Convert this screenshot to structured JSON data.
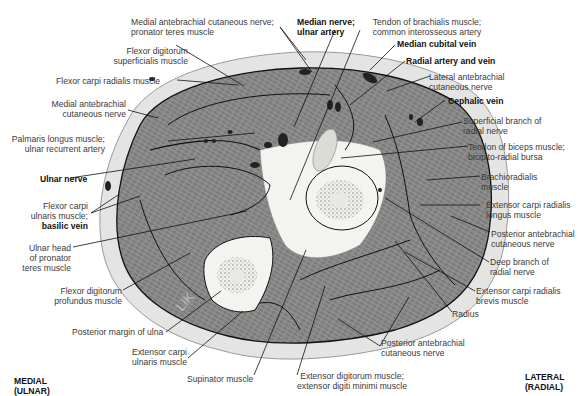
{
  "figure": {
    "orientation": {
      "medial": [
        "MEDIAL",
        "(ULNAR)"
      ],
      "lateral": [
        "LATERAL",
        "(RADIAL)"
      ]
    },
    "watermark": "LIK",
    "labels": {
      "medial_ante_cut_pronator": [
        "Medial antebrachial cutaneous nerve;",
        "pronator teres muscle"
      ],
      "fds": [
        "Flexor digitorum",
        "superficialis muscle"
      ],
      "fcr": "Flexor carpi radialis muscle",
      "medial_ante_cut": [
        "Medial antebrachial",
        "cutaneous nerve"
      ],
      "palmaris": [
        "Palmaris longus muscle;",
        "ulnar recurrent artery"
      ],
      "ulnar_nerve": "Ulnar nerve",
      "fcu": [
        "Flexor carpi",
        "ulnaris muscle;"
      ],
      "basilic_vein": "basilic vein",
      "ulnar_head": [
        "Ulnar head",
        "of pronator",
        "teres muscle"
      ],
      "fdp": [
        "Flexor digitorum",
        "profundus muscle"
      ],
      "post_margin_ulna": "Posterior margin of ulna",
      "ecu": [
        "Extensor carpi",
        "ulnaris muscle"
      ],
      "supinator": "Supinator muscle",
      "ed_edm": [
        "Extensor digitorum muscle;",
        "extensor digiti minimi muscle"
      ],
      "median_nerve_ulnar_artery": [
        "Median nerve;",
        "ulnar artery"
      ],
      "tendon_brachialis": [
        "Tendon of brachialis muscle;",
        "common interosseous artery"
      ],
      "median_cubital": "Median cubital vein",
      "radial_artery_vein": "Radial artery and vein",
      "lateral_ante_cut": [
        "Lateral antebrachial",
        "cutaneous nerve"
      ],
      "cephalic": "Cephalic vein",
      "superficial_radial": [
        "Superficial branch of",
        "radial nerve"
      ],
      "tendon_biceps": [
        "Tendon of biceps muscle;",
        "bicipito-radial bursa"
      ],
      "brachioradialis": [
        "Brachioradialis",
        "muscle"
      ],
      "ecrl": [
        "Extensor carpi radialis",
        "longus muscle"
      ],
      "post_ante_cut_right": [
        "Posterior antebrachial",
        "cutaneous nerve"
      ],
      "deep_radial": [
        "Deep branch of",
        "radial nerve"
      ],
      "ecrb": [
        "Extensor carpi radialis",
        "brevis muscle"
      ],
      "radius": "Radius",
      "post_ante_cut_bottom": [
        "Posterior antebrachial",
        "cutaneous nerve"
      ]
    },
    "colors": {
      "skin": "#e6e6e6",
      "muscle": "#8a8a8a",
      "bone": "#f2f2ee",
      "vessel": "#222222",
      "leader": "#111111"
    }
  }
}
